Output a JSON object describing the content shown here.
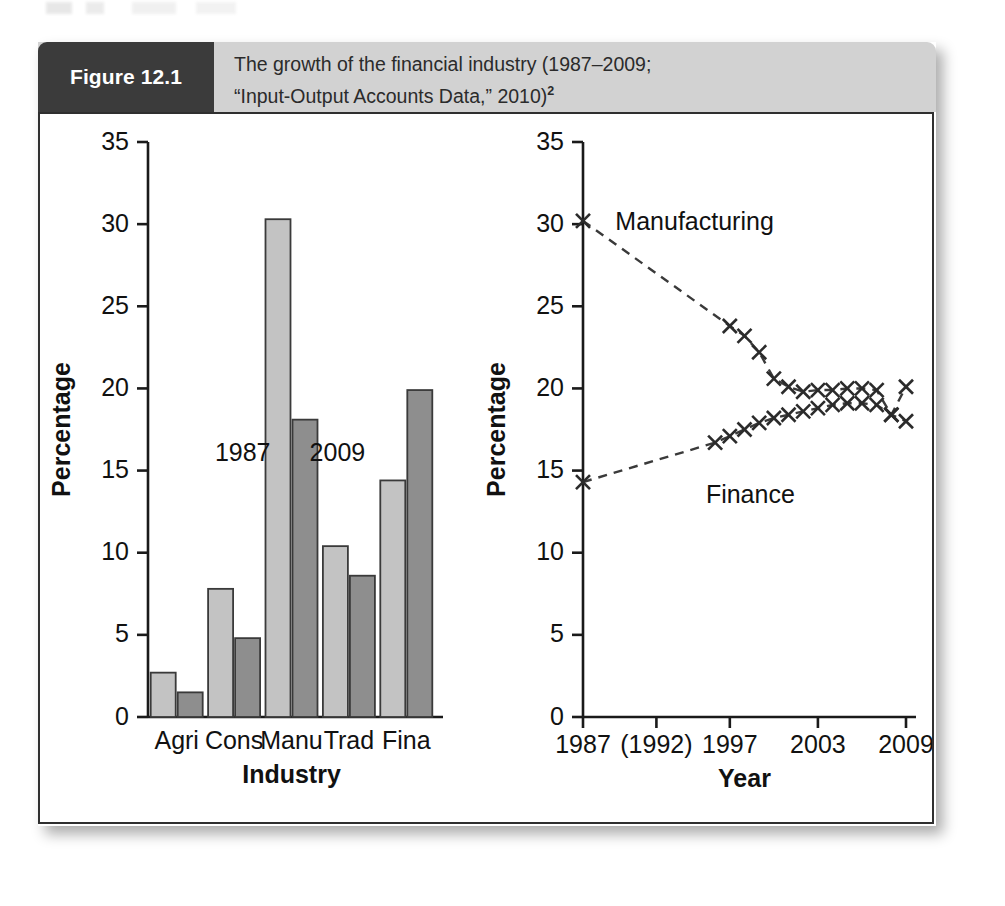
{
  "figure": {
    "number_label": "Figure 12.1",
    "caption_line1": "The growth of the financial industry (1987–2009;",
    "caption_line2": "“Input-Output Accounts Data,” 2010)",
    "caption_superscript": "2"
  },
  "colors": {
    "header_band": "#d2d2d2",
    "number_box": "#3b3b3b",
    "bar_1987": "#c3c3c3",
    "bar_2009": "#8e8e8e",
    "axis": "#1a1a1a",
    "line": "#3a3a3a"
  },
  "chart_data": [
    {
      "type": "bar",
      "title": "",
      "xlabel": "Industry",
      "ylabel": "Percentage",
      "ylim": [
        0,
        35
      ],
      "yticks": [
        0,
        5,
        10,
        15,
        20,
        25,
        30,
        35
      ],
      "ytick_labels": [
        "0",
        "5",
        "10",
        "15",
        "20",
        "25",
        "30",
        "35"
      ],
      "grid": false,
      "legend": "inline-annotations",
      "categories": [
        "Agri",
        "Cons",
        "Manu",
        "Trad",
        "Fina"
      ],
      "series": [
        {
          "name": "1987",
          "values": [
            2.7,
            7.8,
            30.3,
            10.4,
            14.4
          ]
        },
        {
          "name": "2009",
          "values": [
            1.5,
            4.8,
            18.1,
            8.6,
            19.9
          ]
        }
      ],
      "annotations": [
        {
          "text": "1987",
          "x_frac": 0.33,
          "value": 15.6
        },
        {
          "text": "2009",
          "x_frac": 0.66,
          "value": 15.6
        }
      ]
    },
    {
      "type": "line",
      "title": "",
      "xlabel": "Year",
      "ylabel": "Percentage",
      "ylim": [
        0,
        35
      ],
      "yticks": [
        0,
        5,
        10,
        15,
        20,
        25,
        30,
        35
      ],
      "ytick_labels": [
        "0",
        "5",
        "10",
        "15",
        "20",
        "25",
        "30",
        "35"
      ],
      "xlim": [
        1987,
        2009
      ],
      "xticks": [
        1987,
        1992,
        1997,
        2003,
        2009
      ],
      "xtick_labels": [
        "1987",
        "(1992)",
        "1997",
        "2003",
        "2009"
      ],
      "grid": false,
      "marker": "x",
      "linestyle": "dashed",
      "series": [
        {
          "name": "Manufacturing",
          "label_x": 1994.6,
          "label_y": 30.2,
          "x": [
            1987,
            1997,
            1998,
            1999,
            2000,
            2001,
            2002,
            2003,
            2004,
            2005,
            2006,
            2007,
            2008,
            2009
          ],
          "y": [
            30.2,
            23.8,
            23.2,
            22.2,
            20.6,
            20.1,
            19.8,
            19.9,
            19.9,
            20.0,
            20.0,
            19.9,
            18.4,
            20.1
          ]
        },
        {
          "name": "Finance",
          "label_x": 1998.4,
          "label_y": 13.6,
          "x": [
            1987,
            1996,
            1997,
            1998,
            1999,
            2000,
            2001,
            2002,
            2003,
            2004,
            2005,
            2006,
            2007,
            2008,
            2009
          ],
          "y": [
            14.3,
            16.7,
            17.1,
            17.5,
            17.9,
            18.2,
            18.4,
            18.6,
            18.8,
            19.0,
            19.1,
            19.1,
            19.0,
            18.4,
            18.0
          ]
        }
      ]
    }
  ]
}
